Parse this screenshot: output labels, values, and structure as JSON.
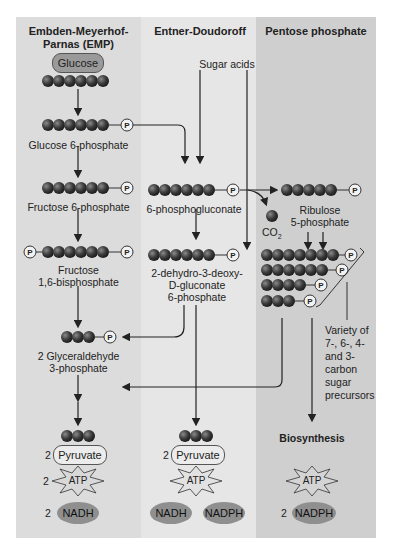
{
  "columns": {
    "emp": {
      "title_line1": "Embden-Meyerhof-",
      "title_line2": "Parnas (EMP)",
      "start": "Glucose",
      "steps": [
        "Glucose 6-phosphate",
        "Fructose 6-phosphate",
        "Fructose",
        "1,6-bisphosphate",
        "2 Glyceraldehyde",
        "3-phosphate"
      ],
      "pyruvate_count": "2",
      "pyruvate": "Pyruvate",
      "atp_count": "2",
      "atp": "ATP",
      "nadh_count": "2",
      "nadh": "NADH"
    },
    "ed": {
      "title": "Entner-Doudoroff",
      "input": "Sugar acids",
      "steps": [
        "6-phosphogluconate",
        "2-dehydro-3-deoxy-",
        "D-gluconate",
        "6-phosphate"
      ],
      "pyruvate_count": "2",
      "pyruvate": "Pyruvate",
      "atp": "ATP",
      "nadh": "NADH",
      "nadph": "NADPH"
    },
    "pp": {
      "title": "Pentose phosphate",
      "co2": "CO",
      "co2_sub": "2",
      "steps": [
        "Ribulose",
        "5-phosphate"
      ],
      "variety_lines": [
        "Variety of",
        "7-, 6-, 4-",
        "and 3-",
        "carbon",
        "sugar",
        "precursors"
      ],
      "biosynthesis": "Biosynthesis",
      "atp": "ATP",
      "nadph_count": "2",
      "nadph": "NADPH"
    }
  },
  "phosphate_label": "P",
  "colors": {
    "emp_bg": "#dcdcdc",
    "ed_bg": "#e6e6e6",
    "pp_bg": "#cfcfcf",
    "carbon_ball": "#3a3a3a",
    "oval": "#8f8f8f"
  }
}
